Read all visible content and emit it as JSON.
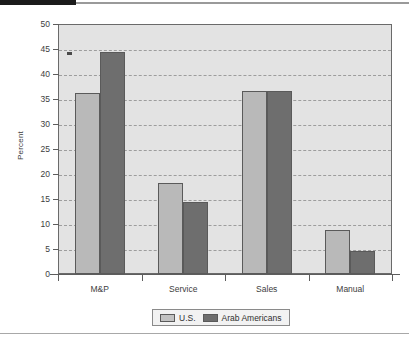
{
  "decor": {
    "top_bar_label": "top-black-bar",
    "accent_color": "#1b1b1b",
    "rule_color": "#9a9a9a"
  },
  "chart_data": {
    "type": "bar",
    "title": "",
    "subtitle": "",
    "xlabel": "",
    "ylabel": "Percent",
    "categories": [
      "M&P",
      "Service",
      "Sales",
      "Manual"
    ],
    "series": [
      {
        "name": "U.S.",
        "color": "#b9b9b9",
        "values": [
          36.2,
          18.2,
          36.6,
          8.8
        ]
      },
      {
        "name": "Arab Americans",
        "color": "#6e6e6e",
        "values": [
          44.4,
          14.4,
          36.6,
          4.6
        ]
      }
    ],
    "ylim": [
      0,
      50
    ],
    "yticks": [
      0,
      5,
      10,
      15,
      20,
      25,
      30,
      35,
      40,
      45,
      50
    ],
    "ytick_labels": [
      "0",
      "5",
      "10",
      "15",
      "20",
      "25",
      "30",
      "35",
      "40",
      "45",
      "50"
    ],
    "grid": true,
    "grid_style": "dashed-horizontal",
    "legend_position": "bottom-center",
    "plot_background": "#e3e3e3"
  },
  "legend": {
    "entries": [
      {
        "label": "U.S.",
        "swatch": "light-gray-swatch"
      },
      {
        "label": "Arab Americans",
        "swatch": "dark-gray-swatch"
      }
    ]
  }
}
